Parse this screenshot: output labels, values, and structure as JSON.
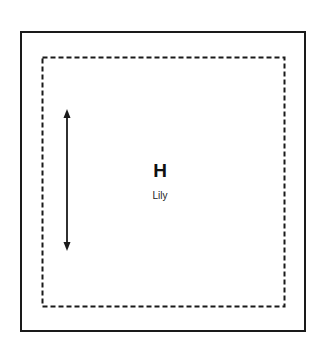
{
  "diagram": {
    "letter": "H",
    "name": "Lily",
    "colors": {
      "stroke": "#1a1a1a",
      "background": "#ffffff"
    },
    "outer_frame": {
      "style": "solid"
    },
    "inner_frame": {
      "style": "dashed"
    },
    "arrow": {
      "orientation": "vertical",
      "heads": "both"
    }
  }
}
